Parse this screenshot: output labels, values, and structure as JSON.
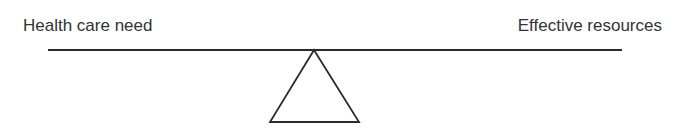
{
  "diagram": {
    "type": "balance-scale",
    "left_label": "Health care need",
    "right_label": "Effective resources",
    "colors": {
      "stroke": "#2b2b2b",
      "text": "#333333",
      "background": "#ffffff"
    }
  }
}
